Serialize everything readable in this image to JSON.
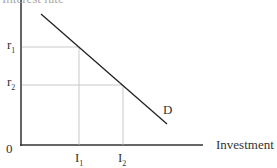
{
  "diagram": {
    "y_axis_label": "Interest rate",
    "x_axis_label": "Investment",
    "origin_label": "0",
    "curve_label": "D",
    "y_ticks": [
      {
        "base": "r",
        "sub": "1"
      },
      {
        "base": "r",
        "sub": "2"
      }
    ],
    "x_ticks": [
      {
        "base": "I",
        "sub": "1"
      },
      {
        "base": "I",
        "sub": "2"
      }
    ],
    "colors": {
      "axis": "#333333",
      "curve": "#222222",
      "guide": "#bbbbbb"
    }
  }
}
